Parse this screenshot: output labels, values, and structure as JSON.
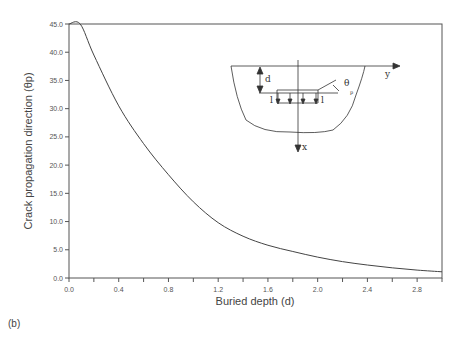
{
  "chart_data": {
    "type": "line",
    "title": "",
    "xlabel": "Buried depth  (d)",
    "ylabel": "Crack propagation direction  (θ_p)",
    "xlim": [
      0.0,
      3.0
    ],
    "ylim": [
      0.0,
      45.0
    ],
    "x_ticks": [
      "0.0",
      "0.4",
      "0.8",
      "1.2",
      "1.6",
      "2.0",
      "2.4",
      "2.8"
    ],
    "y_ticks": [
      "0.0",
      "5.0",
      "10.0",
      "15.0",
      "20.0",
      "25.0",
      "30.0",
      "35.0",
      "40.0",
      "45.0"
    ],
    "grid": false,
    "legend": null,
    "series": [
      {
        "name": "θp vs d",
        "x": [
          0.0,
          0.09,
          0.2,
          0.4,
          0.6,
          0.8,
          1.0,
          1.2,
          1.4,
          1.6,
          1.8,
          2.0,
          2.2,
          2.4,
          2.6,
          2.8,
          3.0
        ],
        "values": [
          45.0,
          45.0,
          39.5,
          30.5,
          23.8,
          18.3,
          13.5,
          9.8,
          7.4,
          5.8,
          4.7,
          3.7,
          2.9,
          2.3,
          1.8,
          1.4,
          1.1
        ]
      }
    ],
    "inset_diagram": {
      "labels": [
        "d",
        "θ",
        "p",
        "y",
        "x",
        "l",
        "l"
      ]
    }
  },
  "panel_label": "(b)"
}
